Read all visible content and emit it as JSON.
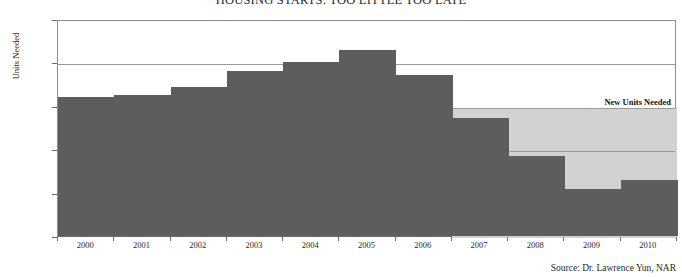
{
  "chart_data": {
    "type": "bar",
    "title": "HOUSING STARTS: TOO LITTLE TOO LATE",
    "xlabel": "",
    "ylabel": "Units Needed",
    "categories": [
      "2000",
      "2001",
      "2002",
      "2003",
      "2004",
      "2005",
      "2006",
      "2007",
      "2008",
      "2009",
      "2010"
    ],
    "values": [
      1600,
      1620,
      1720,
      1900,
      2000,
      2140,
      1860,
      1360,
      920,
      540,
      645
    ],
    "series": [
      {
        "name": "Housing Starts",
        "values": [
          1600,
          1620,
          1720,
          1900,
          2000,
          2140,
          1860,
          1360,
          920,
          540,
          645
        ]
      }
    ],
    "ylim": [
      0,
      2500
    ],
    "ytick_values": [
      0,
      500,
      1000,
      1500,
      2000,
      2500
    ],
    "ytick_labels": [
      "0",
      "500",
      "1,000",
      "1,500",
      "2,000",
      "2,500"
    ],
    "gridlines": [
      1000,
      1500,
      2000
    ],
    "grid": true,
    "legend_position": "none",
    "annotations": [
      {
        "label": "New Units Needed",
        "type": "reference-band",
        "from_value": 0,
        "to_value": 1500,
        "starts_at_category": "2007"
      }
    ],
    "source": "Source: Dr. Lawrence Yun, NAR",
    "colors": {
      "bar": "#5d5d5d",
      "band": "#d2d2d2",
      "grid": "#9a9a9a",
      "axis": "#6b6b6b",
      "text": "#1f1f1f",
      "background": "#ffffff"
    }
  }
}
